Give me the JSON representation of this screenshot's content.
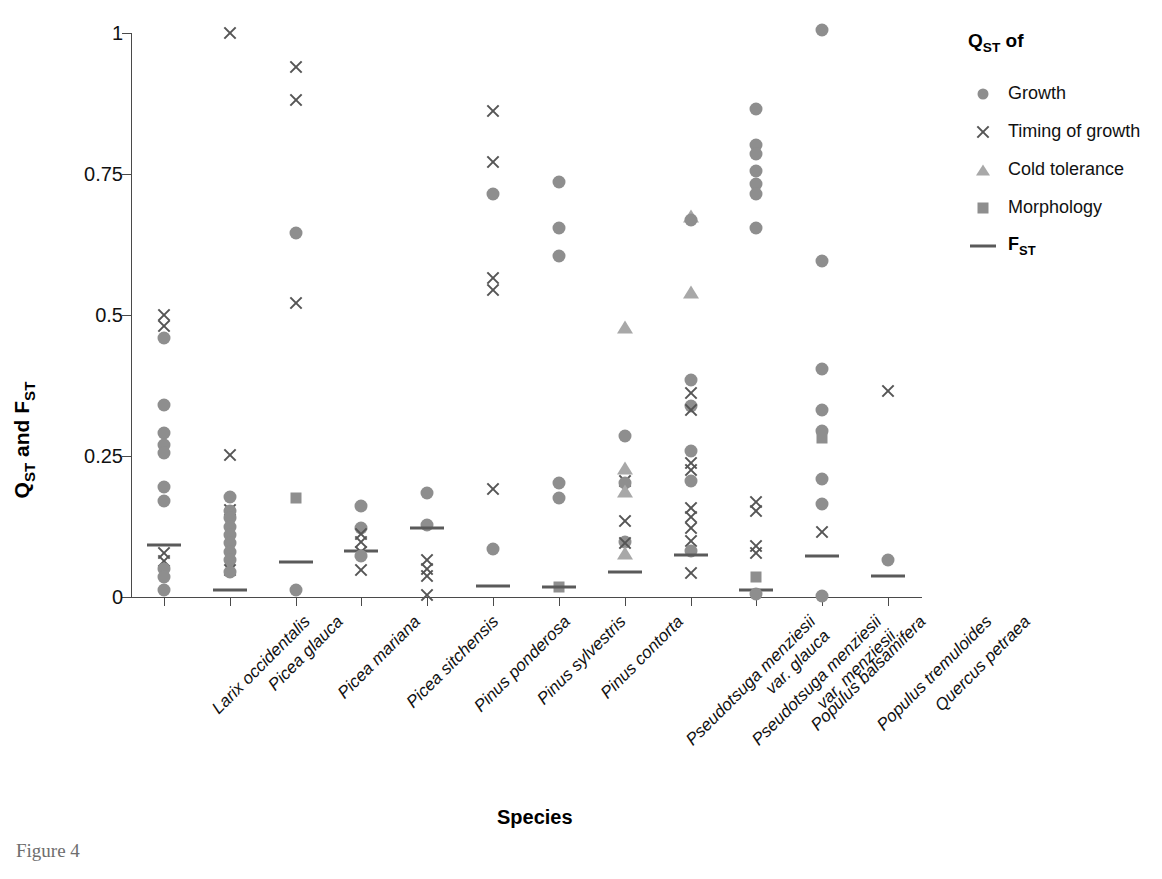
{
  "figure": {
    "caption": "Figure 4",
    "xlabel": "Species",
    "ylabel_parts": {
      "q": "Q",
      "q_sub": "ST",
      "mid": " and ",
      "f": "F",
      "f_sub": "ST"
    }
  },
  "legend": {
    "title_main": "Q",
    "title_sub": "ST",
    "title_tail": " of",
    "items": [
      {
        "label": "Growth",
        "marker": "circle",
        "icon": "filled-circle-icon",
        "color": "#8e8e8e"
      },
      {
        "label": "Timing of growth",
        "marker": "cross",
        "icon": "cross-x-icon",
        "color": "#555555"
      },
      {
        "label": "Cold tolerance",
        "marker": "triangle",
        "icon": "filled-triangle-icon",
        "color": "#a8a8a8"
      },
      {
        "label": "Morphology",
        "marker": "square",
        "icon": "filled-square-icon",
        "color": "#8e8e8e"
      }
    ],
    "fst_item": {
      "label_main": "F",
      "label_sub": "ST",
      "marker": "line",
      "icon": "horizontal-line-icon",
      "color": "#5a5a5a"
    }
  },
  "chart_data": {
    "type": "scatter",
    "title": "",
    "xlabel": "Species",
    "ylabel": "QST and FST",
    "ylim": [
      0,
      1
    ],
    "yticks": [
      0,
      0.25,
      0.5,
      0.75,
      1
    ],
    "ytick_labels": [
      "0",
      "0.25",
      "0.5",
      "0.75",
      "1"
    ],
    "grid": false,
    "legend_position": "right",
    "marker_types": [
      "circle",
      "cross",
      "triangle",
      "square",
      "line"
    ],
    "marker_meanings": {
      "circle": "QST of Growth",
      "cross": "QST of Timing of growth",
      "triangle": "QST of Cold tolerance",
      "square": "QST of Morphology",
      "line": "FST"
    },
    "categories": [
      "Larix occidentalis",
      "Picea glauca",
      "Picea mariana",
      "Picea sitchensis",
      "Pinus ponderosa",
      "Pinus sylvestris",
      "Pinus contorta",
      "Pseudotsuga menziesii var. glauca",
      "Pseudotsuga menziesii var. menziesii",
      "Populus balsamifera",
      "Populus tremuloides",
      "Quercus petraea"
    ],
    "category_label_lines": [
      [
        "Larix occidentalis"
      ],
      [
        "Picea glauca"
      ],
      [
        "Picea mariana"
      ],
      [
        "Picea sitchensis"
      ],
      [
        "Pinus ponderosa"
      ],
      [
        "Pinus sylvestris"
      ],
      [
        "Pinus contorta"
      ],
      [
        "Pseudotsuga menziesii",
        "var. glauca"
      ],
      [
        "Pseudotsuga menziesii",
        "var. menziesii"
      ],
      [
        "Populus balsamifera"
      ],
      [
        "Populus tremuloides"
      ],
      [
        "Quercus petraea"
      ]
    ],
    "series": [
      {
        "category": "Larix occidentalis",
        "points": [
          {
            "marker": "cross",
            "value": 0.5
          },
          {
            "marker": "cross",
            "value": 0.48
          },
          {
            "marker": "circle",
            "value": 0.46
          },
          {
            "marker": "circle",
            "value": 0.34
          },
          {
            "marker": "circle",
            "value": 0.29
          },
          {
            "marker": "circle",
            "value": 0.27
          },
          {
            "marker": "circle",
            "value": 0.255
          },
          {
            "marker": "circle",
            "value": 0.195
          },
          {
            "marker": "circle",
            "value": 0.17
          },
          {
            "marker": "line",
            "value": 0.092
          },
          {
            "marker": "cross",
            "value": 0.078
          },
          {
            "marker": "cross",
            "value": 0.063
          },
          {
            "marker": "circle",
            "value": 0.05
          },
          {
            "marker": "circle",
            "value": 0.035
          },
          {
            "marker": "circle",
            "value": 0.012
          }
        ]
      },
      {
        "category": "Picea glauca",
        "points": [
          {
            "marker": "cross",
            "value": 1.0
          },
          {
            "marker": "cross",
            "value": 0.252
          },
          {
            "marker": "circle",
            "value": 0.178
          },
          {
            "marker": "cross",
            "value": 0.155
          },
          {
            "marker": "circle",
            "value": 0.152
          },
          {
            "marker": "circle",
            "value": 0.14
          },
          {
            "marker": "circle",
            "value": 0.125
          },
          {
            "marker": "circle",
            "value": 0.11
          },
          {
            "marker": "circle",
            "value": 0.095
          },
          {
            "marker": "circle",
            "value": 0.08
          },
          {
            "marker": "circle",
            "value": 0.065
          },
          {
            "marker": "cross",
            "value": 0.048
          },
          {
            "marker": "circle",
            "value": 0.045
          },
          {
            "marker": "line",
            "value": 0.012
          }
        ]
      },
      {
        "category": "Picea mariana",
        "points": [
          {
            "marker": "cross",
            "value": 0.94
          },
          {
            "marker": "cross",
            "value": 0.882
          },
          {
            "marker": "circle",
            "value": 0.645
          },
          {
            "marker": "cross",
            "value": 0.522
          },
          {
            "marker": "square",
            "value": 0.175
          },
          {
            "marker": "line",
            "value": 0.062
          },
          {
            "marker": "circle",
            "value": 0.012
          }
        ]
      },
      {
        "category": "Picea sitchensis",
        "points": [
          {
            "marker": "circle",
            "value": 0.162
          },
          {
            "marker": "circle",
            "value": 0.122
          },
          {
            "marker": "cross",
            "value": 0.112
          },
          {
            "marker": "cross",
            "value": 0.098
          },
          {
            "marker": "line",
            "value": 0.082
          },
          {
            "marker": "cross",
            "value": 0.08
          },
          {
            "marker": "circle",
            "value": 0.072
          },
          {
            "marker": "cross",
            "value": 0.048
          }
        ]
      },
      {
        "category": "Pinus ponderosa",
        "points": [
          {
            "marker": "circle",
            "value": 0.185
          },
          {
            "marker": "circle",
            "value": 0.128
          },
          {
            "marker": "line",
            "value": 0.122
          },
          {
            "marker": "cross",
            "value": 0.065
          },
          {
            "marker": "cross",
            "value": 0.05
          },
          {
            "marker": "cross",
            "value": 0.038
          },
          {
            "marker": "cross",
            "value": 0.003
          }
        ]
      },
      {
        "category": "Pinus sylvestris",
        "points": [
          {
            "marker": "cross",
            "value": 0.862
          },
          {
            "marker": "cross",
            "value": 0.772
          },
          {
            "marker": "circle",
            "value": 0.715
          },
          {
            "marker": "cross",
            "value": 0.565
          },
          {
            "marker": "cross",
            "value": 0.545
          },
          {
            "marker": "cross",
            "value": 0.192
          },
          {
            "marker": "circle",
            "value": 0.085
          },
          {
            "marker": "line",
            "value": 0.02
          }
        ]
      },
      {
        "category": "Pinus contorta",
        "points": [
          {
            "marker": "circle",
            "value": 0.735
          },
          {
            "marker": "circle",
            "value": 0.655
          },
          {
            "marker": "circle",
            "value": 0.605
          },
          {
            "marker": "circle",
            "value": 0.202
          },
          {
            "marker": "circle",
            "value": 0.175
          },
          {
            "marker": "square",
            "value": 0.018
          },
          {
            "marker": "line",
            "value": 0.018
          }
        ]
      },
      {
        "category": "Pseudotsuga menziesii var. glauca",
        "points": [
          {
            "marker": "triangle",
            "value": 0.478
          },
          {
            "marker": "circle",
            "value": 0.285
          },
          {
            "marker": "triangle",
            "value": 0.228
          },
          {
            "marker": "cross",
            "value": 0.205
          },
          {
            "marker": "circle",
            "value": 0.202
          },
          {
            "marker": "triangle",
            "value": 0.188
          },
          {
            "marker": "cross",
            "value": 0.135
          },
          {
            "marker": "circle",
            "value": 0.098
          },
          {
            "marker": "cross",
            "value": 0.095
          },
          {
            "marker": "triangle",
            "value": 0.078
          },
          {
            "marker": "line",
            "value": 0.045
          }
        ]
      },
      {
        "category": "Pseudotsuga menziesii var. menziesii",
        "points": [
          {
            "marker": "triangle",
            "value": 0.675
          },
          {
            "marker": "circle",
            "value": 0.668
          },
          {
            "marker": "triangle",
            "value": 0.54
          },
          {
            "marker": "circle",
            "value": 0.385
          },
          {
            "marker": "cross",
            "value": 0.362
          },
          {
            "marker": "circle",
            "value": 0.338
          },
          {
            "marker": "cross",
            "value": 0.332
          },
          {
            "marker": "circle",
            "value": 0.258
          },
          {
            "marker": "cross",
            "value": 0.238
          },
          {
            "marker": "cross",
            "value": 0.225
          },
          {
            "marker": "circle",
            "value": 0.205
          },
          {
            "marker": "cross",
            "value": 0.158
          },
          {
            "marker": "cross",
            "value": 0.142
          },
          {
            "marker": "cross",
            "value": 0.122
          },
          {
            "marker": "cross",
            "value": 0.1
          },
          {
            "marker": "circle",
            "value": 0.082
          },
          {
            "marker": "line",
            "value": 0.075
          },
          {
            "marker": "cross",
            "value": 0.042
          }
        ]
      },
      {
        "category": "Populus balsamifera",
        "points": [
          {
            "marker": "circle",
            "value": 0.865
          },
          {
            "marker": "circle",
            "value": 0.802
          },
          {
            "marker": "circle",
            "value": 0.785
          },
          {
            "marker": "circle",
            "value": 0.755
          },
          {
            "marker": "circle",
            "value": 0.732
          },
          {
            "marker": "circle",
            "value": 0.715
          },
          {
            "marker": "circle",
            "value": 0.655
          },
          {
            "marker": "cross",
            "value": 0.168
          },
          {
            "marker": "cross",
            "value": 0.152
          },
          {
            "marker": "cross",
            "value": 0.09
          },
          {
            "marker": "cross",
            "value": 0.078
          },
          {
            "marker": "square",
            "value": 0.035
          },
          {
            "marker": "line",
            "value": 0.012
          },
          {
            "marker": "circle",
            "value": 0.005
          }
        ]
      },
      {
        "category": "Populus tremuloides",
        "points": [
          {
            "marker": "circle",
            "value": 1.005
          },
          {
            "marker": "circle",
            "value": 0.595
          },
          {
            "marker": "circle",
            "value": 0.405
          },
          {
            "marker": "circle",
            "value": 0.332
          },
          {
            "marker": "circle",
            "value": 0.295
          },
          {
            "marker": "square",
            "value": 0.282
          },
          {
            "marker": "circle",
            "value": 0.21
          },
          {
            "marker": "circle",
            "value": 0.165
          },
          {
            "marker": "cross",
            "value": 0.115
          },
          {
            "marker": "line",
            "value": 0.072
          },
          {
            "marker": "circle",
            "value": 0.002
          }
        ]
      },
      {
        "category": "Quercus petraea",
        "points": [
          {
            "marker": "cross",
            "value": 0.365
          },
          {
            "marker": "circle",
            "value": 0.065
          },
          {
            "marker": "line",
            "value": 0.037
          }
        ]
      }
    ]
  }
}
